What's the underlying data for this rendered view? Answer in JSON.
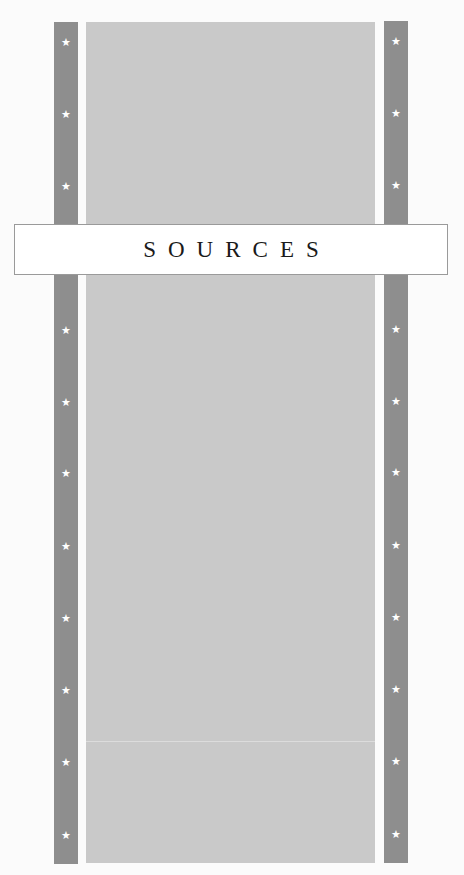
{
  "banner": {
    "title": "SOURCES"
  },
  "colors": {
    "background": "#fbfbfb",
    "stripe": "#8e8e8e",
    "panel": "#c9c9c9",
    "star": "#ffffff",
    "banner_border": "#9a9a9a"
  },
  "stars": {
    "glyph": "★",
    "icon": "star-icon",
    "positions_y": [
      21,
      93,
      165,
      309,
      381,
      452,
      525,
      597,
      669,
      741,
      814
    ]
  }
}
